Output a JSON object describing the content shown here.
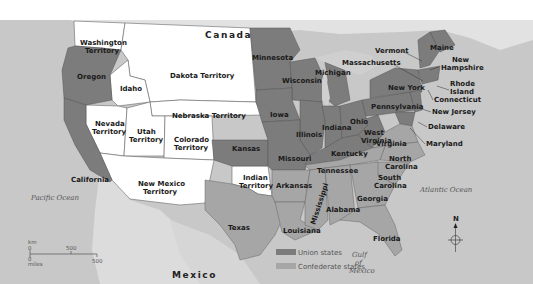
{
  "map": {
    "colors": {
      "ocean": "#c8c8c8",
      "foreign_land": "#dedede",
      "union": "#7c7c7c",
      "confederate": "#a6a6a6",
      "territory": "#ffffff"
    },
    "countries": {
      "canada": "Canada",
      "mexico": "Mexico"
    },
    "water": {
      "pacific": "Pacific Ocean",
      "atlantic": "Atlantic Ocean",
      "gulf_line1": "Gulf",
      "gulf_line2": "of",
      "gulf_line3": "Mexico"
    },
    "territories": {
      "washington_1": "Washington",
      "washington_2": "Territory",
      "dakota": "Dakota Territory",
      "idaho": "Idaho",
      "nebraska": "Nebraska Territory",
      "nevada_1": "Nevada",
      "nevada_2": "Territory",
      "utah_1": "Utah",
      "utah_2": "Territory",
      "colorado_1": "Colorado",
      "colorado_2": "Territory",
      "new_mexico_1": "New Mexico",
      "new_mexico_2": "Territory",
      "indian_1": "Indian",
      "indian_2": "Territory"
    },
    "union_states": {
      "oregon": "Oregon",
      "california": "California",
      "minnesota": "Minnesota",
      "wisconsin": "Wisconsin",
      "michigan": "Michigan",
      "iowa": "Iowa",
      "illinois": "Illinois",
      "indiana": "Indiana",
      "ohio": "Ohio",
      "kansas": "Kansas",
      "missouri": "Missouri",
      "kentucky": "Kentucky",
      "west_virginia_1": "West",
      "west_virginia_2": "Virginia",
      "pennsylvania": "Pennsylvania",
      "new_york": "New York",
      "vermont": "Vermont",
      "maine": "Maine",
      "new_hampshire_1": "New",
      "new_hampshire_2": "Hampshire",
      "massachusetts": "Massachusetts",
      "rhode_island_1": "Rhode",
      "rhode_island_2": "Island",
      "connecticut": "Connecticut",
      "new_jersey": "New Jersey",
      "delaware": "Delaware",
      "maryland": "Maryland"
    },
    "confederate_states": {
      "virginia": "Virginia",
      "north_carolina_1": "North",
      "north_carolina_2": "Carolina",
      "south_carolina_1": "South",
      "south_carolina_2": "Carolina",
      "tennessee": "Tennessee",
      "arkansas": "Arkansas",
      "texas": "Texas",
      "louisiana": "Louisiana",
      "mississippi": "Mississippi",
      "alabama": "Alabama",
      "georgia": "Georgia",
      "florida": "Florida"
    },
    "legend": {
      "union_label": "Union states",
      "confederate_label": "Confederate states"
    },
    "scale": {
      "km_label": "km",
      "km_zero": "0",
      "km_value": "500",
      "miles_zero": "0",
      "miles_label": "miles",
      "miles_value": "500"
    },
    "compass": {
      "north": "N"
    }
  }
}
